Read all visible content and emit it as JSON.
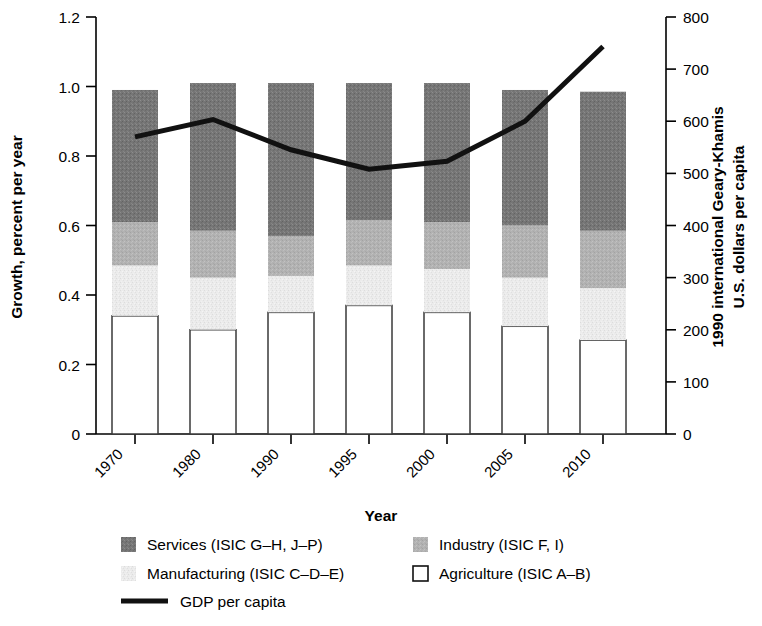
{
  "chart_data": {
    "type": "bar",
    "title": "",
    "categories": [
      "1970",
      "1980",
      "1990",
      "1995",
      "2000",
      "2005",
      "2010"
    ],
    "xlabel": "Year",
    "ylabel": "Growth, percent per year",
    "ylabel_right": "1990 international Geary-Khamis U.S. dollars per capita",
    "ylim": [
      0,
      1.2
    ],
    "yticks": [
      "0",
      "0.2",
      "0.4",
      "0.6",
      "0.8",
      "1.0",
      "1.2"
    ],
    "ytick_values": [
      0,
      0.2,
      0.4,
      0.6,
      0.8,
      1.0,
      1.2
    ],
    "ylim_right": [
      0,
      800
    ],
    "yticks_right": [
      "0",
      "100",
      "200",
      "300",
      "400",
      "500",
      "600",
      "700",
      "800"
    ],
    "ytick_values_right": [
      0,
      100,
      200,
      300,
      400,
      500,
      600,
      700,
      800
    ],
    "grid": false,
    "stacked": true,
    "legend_position": "bottom",
    "series": [
      {
        "name": "Agriculture (ISIC A–B)",
        "color": "#ffffff",
        "order": 1,
        "values": [
          0.34,
          0.3,
          0.35,
          0.37,
          0.35,
          0.31,
          0.27
        ]
      },
      {
        "name": "Manufacturing (ISIC C–D–E)",
        "color": "#e8e8e8",
        "order": 2,
        "values": [
          0.145,
          0.15,
          0.105,
          0.115,
          0.125,
          0.14,
          0.15
        ]
      },
      {
        "name": "Industry (ISIC F, I)",
        "color": "#b0b0b0",
        "order": 3,
        "values": [
          0.125,
          0.135,
          0.115,
          0.13,
          0.135,
          0.15,
          0.165
        ]
      },
      {
        "name": "Services (ISIC G–H, J–P)",
        "color": "#767676",
        "order": 4,
        "values": [
          0.38,
          0.425,
          0.44,
          0.395,
          0.4,
          0.39,
          0.4
        ]
      }
    ],
    "bar_totals": [
      0.99,
      1.01,
      1.01,
      1.01,
      1.01,
      0.99,
      0.985
    ],
    "line_series": {
      "name": "GDP per capita",
      "color": "#111111",
      "axis": "right",
      "x": [
        "1970",
        "1980",
        "1990",
        "1995",
        "2000",
        "2005",
        "2010"
      ],
      "values_right_axis": [
        570,
        603,
        545,
        508,
        523,
        600,
        743
      ],
      "values_left_axis": [
        0.855,
        0.905,
        0.818,
        0.762,
        0.785,
        0.9,
        1.115
      ]
    },
    "legend": [
      {
        "label": "Services (ISIC G–H, J–P)",
        "swatch": "dark-gray",
        "type": "square"
      },
      {
        "label": "Industry (ISIC F, I)",
        "swatch": "mid-gray",
        "type": "square"
      },
      {
        "label": "Manufacturing (ISIC C–D–E)",
        "swatch": "light-gray",
        "type": "square"
      },
      {
        "label": "Agriculture (ISIC A–B)",
        "swatch": "white",
        "type": "square-outline"
      },
      {
        "label": "GDP per capita",
        "swatch": "black",
        "type": "line"
      }
    ],
    "colors": {
      "services": "#767676",
      "industry": "#b0b0b0",
      "manufacturing": "#e8e8e8",
      "agriculture": "#ffffff",
      "gdp_line": "#111111",
      "axis": "#000000"
    }
  }
}
